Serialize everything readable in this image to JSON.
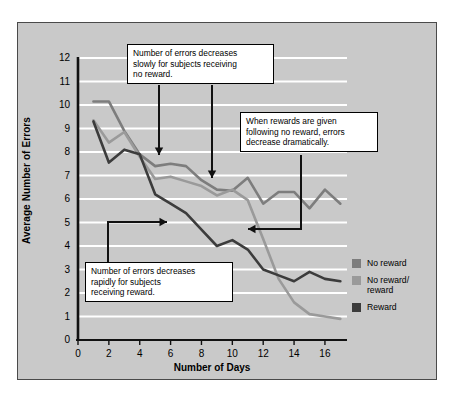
{
  "chart_data": {
    "type": "line",
    "title": "",
    "xlabel": "Number of Days",
    "ylabel": "Average Number of Errors",
    "xlim": [
      0,
      17.3
    ],
    "ylim": [
      0,
      12
    ],
    "grid": "horizontal-white",
    "legend_position": "right",
    "xticks": [
      "0",
      "2",
      "4",
      "6",
      "8",
      "10",
      "12",
      "14",
      "16"
    ],
    "yticks": [
      "0",
      "1",
      "2",
      "3",
      "4",
      "5",
      "6",
      "7",
      "8",
      "9",
      "10",
      "11",
      "12"
    ],
    "x": [
      1,
      2,
      3,
      4,
      5,
      6,
      7,
      8,
      9,
      10,
      11,
      12,
      13,
      14,
      15,
      16,
      17
    ],
    "series": [
      {
        "name": "No reward",
        "color": "#7d7d7d",
        "values": [
          10.15,
          10.15,
          8.9,
          7.9,
          7.4,
          7.5,
          7.4,
          6.8,
          6.4,
          6.35,
          6.9,
          5.8,
          6.3,
          6.3,
          5.6,
          6.4,
          5.8
        ]
      },
      {
        "name": "No reward/\nreward",
        "color": "#9a9a9a",
        "values": [
          9.35,
          8.4,
          8.85,
          7.8,
          6.85,
          6.95,
          6.75,
          6.55,
          6.15,
          6.4,
          5.95,
          4.3,
          2.6,
          1.6,
          1.1,
          1.0,
          0.9
        ]
      },
      {
        "name": "Reward",
        "color": "#3c3c3c",
        "values": [
          9.3,
          7.55,
          8.1,
          7.9,
          6.2,
          5.8,
          5.4,
          4.7,
          4.0,
          4.25,
          3.85,
          3.0,
          2.75,
          2.5,
          2.9,
          2.6,
          2.5
        ]
      }
    ],
    "annotations": [
      {
        "name": "no-reward-note",
        "lines": [
          "Number of errors decreases",
          "slowly for subjects receiving",
          "no reward."
        ]
      },
      {
        "name": "reward-after-no-reward-note",
        "lines": [
          "When rewards are given",
          "following no reward, errors",
          "decrease dramatically."
        ]
      },
      {
        "name": "reward-note",
        "lines": [
          "Number of errors decreases",
          "rapidly for subjects",
          "receiving reward."
        ]
      }
    ]
  },
  "legend": {
    "items": [
      {
        "label": "No reward",
        "color": "#7d7d7d"
      },
      {
        "label": "No reward/\nreward",
        "color": "#9a9a9a"
      },
      {
        "label": "Reward",
        "color": "#3c3c3c"
      }
    ]
  }
}
